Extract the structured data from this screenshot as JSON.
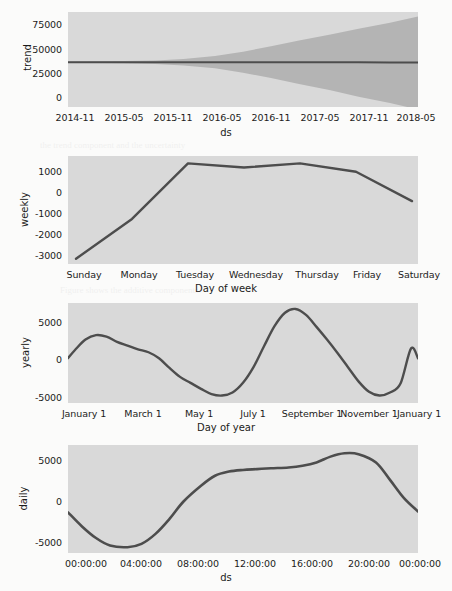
{
  "figure": {
    "title": "",
    "kind": "prophet-forecast-components"
  },
  "panels": [
    {
      "key": "trend",
      "ylabel": "trend",
      "xlabel": "ds",
      "yticks": [
        "0",
        "25000",
        "50000",
        "75000"
      ],
      "xticks": [
        "2014-11",
        "2015-05",
        "2015-11",
        "2016-05",
        "2016-11",
        "2017-05",
        "2017-11",
        "2018-05"
      ]
    },
    {
      "key": "weekly",
      "ylabel": "weekly",
      "xlabel": "Day of week",
      "yticks": [
        "-3000",
        "-2000",
        "-1000",
        "0",
        "1000"
      ],
      "xticks": [
        "Sunday",
        "Monday",
        "Tuesday",
        "Wednesday",
        "Thursday",
        "Friday",
        "Saturday"
      ]
    },
    {
      "key": "yearly",
      "ylabel": "yearly",
      "xlabel": "Day of year",
      "yticks": [
        "-5000",
        "0",
        "5000"
      ],
      "xticks": [
        "January 1",
        "March 1",
        "May 1",
        "July 1",
        "September 1",
        "November 1",
        "January 1"
      ]
    },
    {
      "key": "daily",
      "ylabel": "daily",
      "xlabel": "ds",
      "yticks": [
        "-5000",
        "0",
        "5000"
      ],
      "xticks": [
        "00:00:00",
        "04:00:00",
        "08:00:00",
        "12:00:00",
        "16:00:00",
        "20:00:00",
        "00:00:00"
      ]
    }
  ],
  "colors": {
    "line": "#4d4d4d",
    "band": "#b4b4b4",
    "panel_background": "#d9d9d9",
    "grid": "#f2f2f2",
    "page_background": "#fbfbfa",
    "text": "#1b1b1b"
  },
  "chart_data": [
    {
      "type": "line",
      "name": "trend",
      "title": "",
      "xlabel": "ds",
      "ylabel": "trend",
      "grid": true,
      "legend": "none",
      "xticklabels": [
        "2014-11",
        "2015-05",
        "2015-11",
        "2016-05",
        "2016-11",
        "2017-05",
        "2017-11",
        "2018-05"
      ],
      "yticks": [
        0,
        25000,
        50000,
        75000
      ],
      "ylim": [
        -15000,
        82000
      ],
      "x": [
        0,
        0.08,
        0.16,
        0.25,
        0.33,
        0.42,
        0.5,
        0.58,
        0.66,
        0.75,
        0.83,
        0.92,
        1.0
      ],
      "values": [
        30800,
        30780,
        30760,
        30740,
        30720,
        30700,
        30680,
        30660,
        30640,
        30620,
        30600,
        30560,
        30500
      ],
      "uncertainty": {
        "upper": [
          31500,
          31600,
          31900,
          32600,
          34000,
          37000,
          41500,
          47000,
          53000,
          59000,
          65000,
          71000,
          77500
        ],
        "lower": [
          30100,
          29950,
          29600,
          28900,
          27400,
          24500,
          20000,
          14500,
          8500,
          2200,
          -4500,
          -11000,
          -17500
        ]
      }
    },
    {
      "type": "line",
      "name": "weekly",
      "title": "",
      "xlabel": "Day of week",
      "ylabel": "weekly",
      "grid": true,
      "legend": "none",
      "categories": [
        "Sunday",
        "Monday",
        "Tuesday",
        "Wednesday",
        "Thursday",
        "Friday",
        "Saturday"
      ],
      "values": [
        -3150,
        -1250,
        1400,
        1200,
        1400,
        1000,
        -400
      ],
      "yticks": [
        -3000,
        -2000,
        -1000,
        0,
        1000
      ],
      "ylim": [
        -3400,
        1750
      ]
    },
    {
      "type": "line",
      "name": "yearly",
      "title": "",
      "xlabel": "Day of year",
      "ylabel": "yearly",
      "grid": true,
      "legend": "none",
      "xticklabels": [
        "January 1",
        "March 1",
        "May 1",
        "July 1",
        "September 1",
        "November 1",
        "January 1"
      ],
      "yticks": [
        -5000,
        0,
        5000
      ],
      "ylim": [
        -5600,
        7800
      ],
      "x": [
        0,
        0.02,
        0.05,
        0.08,
        0.11,
        0.14,
        0.17,
        0.2,
        0.23,
        0.26,
        0.29,
        0.32,
        0.35,
        0.38,
        0.41,
        0.44,
        0.47,
        0.5,
        0.53,
        0.56,
        0.59,
        0.62,
        0.65,
        0.68,
        0.71,
        0.74,
        0.77,
        0.8,
        0.83,
        0.86,
        0.89,
        0.92,
        0.95,
        0.98,
        1.0
      ],
      "values": [
        400,
        1500,
        2900,
        3500,
        3300,
        2600,
        2100,
        1600,
        1200,
        400,
        -900,
        -2100,
        -2900,
        -3700,
        -4400,
        -4600,
        -4200,
        -2900,
        -800,
        2000,
        4700,
        6500,
        7000,
        6200,
        4600,
        2900,
        1100,
        -800,
        -2700,
        -4100,
        -4600,
        -4200,
        -3000,
        1700,
        400
      ]
    },
    {
      "type": "line",
      "name": "daily",
      "title": "",
      "xlabel": "ds",
      "ylabel": "daily",
      "grid": true,
      "legend": "none",
      "xticklabels": [
        "00:00:00",
        "04:00:00",
        "08:00:00",
        "12:00:00",
        "16:00:00",
        "20:00:00",
        "00:00:00"
      ],
      "yticks": [
        -5000,
        0,
        5000
      ],
      "ylim": [
        -7400,
        5600
      ],
      "x": [
        0,
        0.04,
        0.08,
        0.12,
        0.17,
        0.21,
        0.25,
        0.29,
        0.33,
        0.38,
        0.42,
        0.46,
        0.5,
        0.54,
        0.58,
        0.63,
        0.67,
        0.71,
        0.75,
        0.79,
        0.83,
        0.88,
        0.92,
        0.96,
        1.0
      ],
      "values": [
        -2500,
        -4200,
        -5600,
        -6500,
        -6700,
        -6300,
        -5100,
        -3300,
        -1200,
        700,
        1900,
        2400,
        2600,
        2700,
        2800,
        2900,
        3100,
        3500,
        4200,
        4600,
        4500,
        3500,
        1400,
        -800,
        -2400
      ]
    }
  ],
  "bleed_text": [
    "the trend component and the uncertainty",
    "components of the seasonal model",
    "Figure shows the additive components"
  ]
}
